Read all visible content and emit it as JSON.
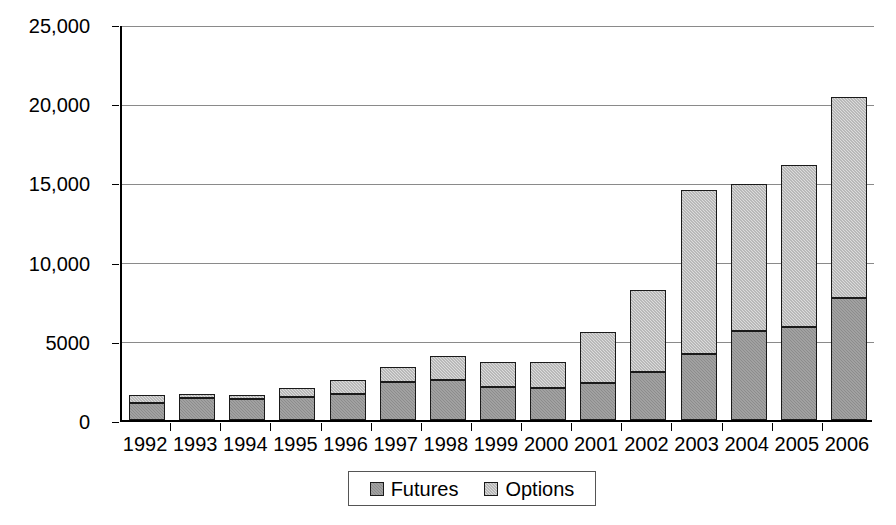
{
  "chart_data": {
    "type": "bar",
    "subtype": "stacked",
    "title": "",
    "xlabel": "",
    "ylabel": "",
    "categories": [
      "1992",
      "1993",
      "1994",
      "1995",
      "1996",
      "1997",
      "1998",
      "1999",
      "2000",
      "2001",
      "2002",
      "2003",
      "2004",
      "2005",
      "2006"
    ],
    "series": [
      {
        "name": "Futures",
        "color": "#8c8c8c",
        "values": [
          1075,
          1400,
          1350,
          1450,
          1650,
          2400,
          2530,
          2100,
          2050,
          2340,
          3050,
          4180,
          5600,
          5900,
          7700
        ]
      },
      {
        "name": "Options",
        "color": "#dcdcdc",
        "values": [
          500,
          250,
          250,
          580,
          900,
          950,
          1520,
          1570,
          1630,
          3230,
          5180,
          10370,
          9300,
          10200,
          12700
        ]
      }
    ],
    "totals": [
      1575,
      1650,
      1600,
      2030,
      2550,
      3350,
      4050,
      3670,
      3680,
      5570,
      8230,
      14550,
      14900,
      16100,
      20400
    ],
    "ylim": [
      0,
      25000
    ],
    "y_ticks": [
      0,
      5000,
      10000,
      15000,
      20000,
      25000
    ],
    "y_tick_labels": [
      "0",
      "5000",
      "10,000",
      "15,000",
      "20,000",
      "25,000"
    ],
    "grid": true,
    "legend_position": "bottom"
  },
  "legend": {
    "items": [
      {
        "label": "Futures",
        "swatch": "futures-swatch"
      },
      {
        "label": "Options",
        "swatch": "options-swatch"
      }
    ]
  }
}
